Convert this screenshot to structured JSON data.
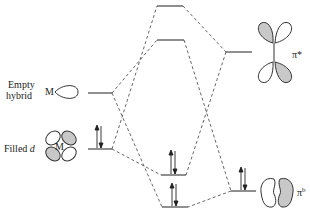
{
  "diagram": {
    "type": "molecular-orbital-diagram",
    "labels": {
      "empty_hybrid_line1": "Empty",
      "empty_hybrid_line2": "hybrid",
      "filled_d": "Filled ",
      "filled_d_italic": "d",
      "metal_symbol": "M",
      "pi_star": "π*",
      "pi_bonding": "π",
      "pi_bonding_sup": "b"
    },
    "levels": [
      {
        "id": "sigma-star",
        "x1": 157,
        "x2": 183,
        "y": 6,
        "electrons": 0
      },
      {
        "id": "pi-star-complex",
        "x1": 157,
        "x2": 184,
        "y": 40,
        "electrons": 0
      },
      {
        "id": "empty-hybrid",
        "x1": 88,
        "x2": 112,
        "y": 93,
        "electrons": 0
      },
      {
        "id": "filled-d",
        "x1": 88,
        "x2": 112,
        "y": 149,
        "electrons": 2
      },
      {
        "id": "bonding-d",
        "x1": 161,
        "x2": 186,
        "y": 175,
        "electrons": 2
      },
      {
        "id": "bonding-sigma",
        "x1": 162,
        "x2": 188,
        "y": 207,
        "electrons": 2
      },
      {
        "id": "ligand-pi-star",
        "x1": 226,
        "x2": 252,
        "y": 52,
        "electrons": 0
      },
      {
        "id": "ligand-pi-bonding",
        "x1": 231,
        "x2": 256,
        "y": 191,
        "electrons": 2
      }
    ],
    "colors": {
      "line": "#333333",
      "shade": "#c8c8c8"
    }
  }
}
